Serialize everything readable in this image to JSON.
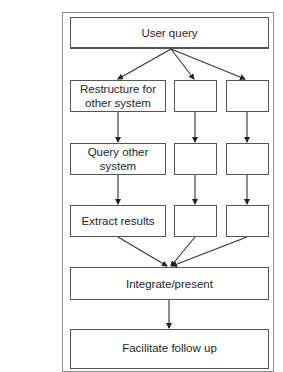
{
  "diagram": {
    "title_fragment": "",
    "nodes": {
      "user_query": "User query",
      "restructure": "Restructure for other system",
      "query_other": "Query other system",
      "extract": "Extract results",
      "mid_1": "",
      "mid_2": "",
      "mid_3": "",
      "right_1": "",
      "right_2": "",
      "right_3": "",
      "integrate": "Integrate/present",
      "follow_up": "Facilitate follow up"
    },
    "edges": [
      [
        "user_query",
        "restructure"
      ],
      [
        "user_query",
        "mid_1"
      ],
      [
        "user_query",
        "right_1"
      ],
      [
        "restructure",
        "query_other"
      ],
      [
        "mid_1",
        "mid_2"
      ],
      [
        "right_1",
        "right_2"
      ],
      [
        "query_other",
        "extract"
      ],
      [
        "mid_2",
        "mid_3"
      ],
      [
        "right_2",
        "right_3"
      ],
      [
        "extract",
        "integrate"
      ],
      [
        "mid_3",
        "integrate"
      ],
      [
        "right_3",
        "integrate"
      ],
      [
        "integrate",
        "follow_up"
      ]
    ],
    "colors": {
      "box_border": "#555555",
      "frame_border": "#8c8c8c",
      "arrow": "#333333",
      "text": "#262626"
    }
  }
}
